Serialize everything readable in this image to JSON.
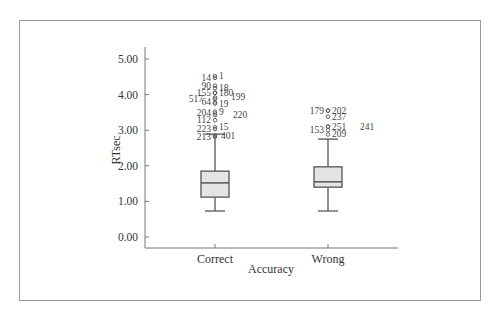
{
  "chart_data": {
    "type": "box",
    "title": "",
    "xlabel": "Accuracy",
    "ylabel": "RTsec",
    "ylim": [
      0,
      5
    ],
    "yticks": [
      "0.00",
      "1.00",
      "2.00",
      "3.00",
      "4.00",
      "5.00"
    ],
    "grid": false,
    "legend": null,
    "categories": [
      "Correct",
      "Wrong"
    ],
    "series": [
      {
        "name": "Correct",
        "whisker_low": 0.73,
        "q1": 1.12,
        "median": 1.52,
        "q3": 1.85,
        "whisker_high": 2.89,
        "outliers": [
          {
            "id": "14",
            "value": 4.47
          },
          {
            "id": "1",
            "value": 4.52
          },
          {
            "id": "90",
            "value": 4.25
          },
          {
            "id": "18",
            "value": 4.18
          },
          {
            "id": "155",
            "value": 4.05
          },
          {
            "id": "180",
            "value": 4.05
          },
          {
            "id": "517",
            "value": 3.88
          },
          {
            "id": "199",
            "value": 3.92
          },
          {
            "id": "64",
            "value": 3.78
          },
          {
            "id": "19",
            "value": 3.75
          },
          {
            "id": "204",
            "value": 3.47
          },
          {
            "id": "9",
            "value": 3.52
          },
          {
            "id": "220",
            "value": 3.42
          },
          {
            "id": "112",
            "value": 3.28
          },
          {
            "id": "223",
            "value": 3.03
          },
          {
            "id": "15",
            "value": 3.08
          },
          {
            "id": "213",
            "value": 2.82
          },
          {
            "id": "401",
            "value": 2.85
          }
        ]
      },
      {
        "name": "Wrong",
        "whisker_low": 0.73,
        "q1": 1.4,
        "median": 1.55,
        "q3": 1.97,
        "whisker_high": 2.75,
        "outliers": [
          {
            "id": "179",
            "value": 3.55
          },
          {
            "id": "202",
            "value": 3.55
          },
          {
            "id": "237",
            "value": 3.38
          },
          {
            "id": "251",
            "value": 3.1
          },
          {
            "id": "241",
            "value": 3.1
          },
          {
            "id": "153",
            "value": 3.0
          },
          {
            "id": "209",
            "value": 2.88
          }
        ]
      }
    ]
  },
  "colors": {
    "box_fill": "#e4e4e4",
    "stroke": "#555555",
    "frame": "#9a9a9a"
  }
}
